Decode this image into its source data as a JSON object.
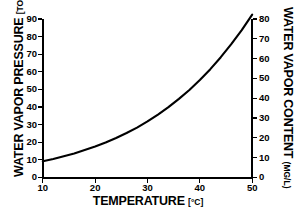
{
  "chart_data": {
    "type": "line",
    "title": "",
    "xlabel": "TEMPERATURE",
    "xunit": "[°C]",
    "ylabel": "WATER VAPOR PRESSURE",
    "yunit": "[TORR]",
    "ylabel_right": "WATER VAPOR CONTENT",
    "yunit_right": "(MG/L)",
    "grid": false,
    "legend": "none",
    "xlim": [
      10,
      50
    ],
    "ylim": [
      0,
      90
    ],
    "ylim_right": [
      0,
      80
    ],
    "xticks": [
      10,
      20,
      30,
      40,
      50
    ],
    "xticklabels": [
      "10",
      "20",
      "30",
      "40",
      "50"
    ],
    "yticks": [
      0,
      10,
      20,
      30,
      40,
      50,
      60,
      70,
      80,
      90
    ],
    "yticklabels": [
      "0",
      "10",
      "20",
      "30",
      "40",
      "50",
      "60",
      "70",
      "80",
      "90"
    ],
    "yticks_right": [
      0,
      10,
      20,
      30,
      40,
      50,
      60,
      70,
      80
    ],
    "yticklabels_right": [
      "0",
      "10",
      "20",
      "30",
      "40",
      "50",
      "60",
      "70",
      "80"
    ],
    "series": [
      {
        "name": "Saturated water vapor pressure",
        "x": [
          10,
          12,
          14,
          16,
          18,
          20,
          22,
          24,
          26,
          28,
          30,
          32,
          34,
          36,
          38,
          40,
          42,
          44,
          46,
          48,
          50
        ],
        "values": [
          9.2,
          10.5,
          12.0,
          13.6,
          15.5,
          17.5,
          19.8,
          22.4,
          25.2,
          28.3,
          31.8,
          35.7,
          39.9,
          44.6,
          49.7,
          55.3,
          61.5,
          68.3,
          75.7,
          83.7,
          92.5
        ]
      }
    ],
    "colors": {
      "curve": "#000000",
      "axis": "#000000",
      "background": "#ffffff"
    }
  }
}
